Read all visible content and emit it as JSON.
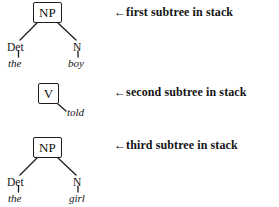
{
  "figure": {
    "background_color": "#ffffff",
    "ink_color": "#141414"
  },
  "arrow_glyph": "←",
  "subtrees": [
    {
      "id": "first",
      "root": {
        "label": "NP",
        "boxed": true
      },
      "children": [
        {
          "category": "Det",
          "word": "the"
        },
        {
          "category": "N",
          "word": "boy"
        }
      ],
      "annotation": "first subtree in stack"
    },
    {
      "id": "second",
      "root": {
        "label": "V",
        "boxed": true
      },
      "children": [
        {
          "category": "",
          "word": "told"
        }
      ],
      "annotation": "second subtree in stack"
    },
    {
      "id": "third",
      "root": {
        "label": "NP",
        "boxed": true
      },
      "children": [
        {
          "category": "Det",
          "word": "the"
        },
        {
          "category": "N",
          "word": "girl"
        }
      ],
      "annotation": "third subtree in stack"
    }
  ]
}
